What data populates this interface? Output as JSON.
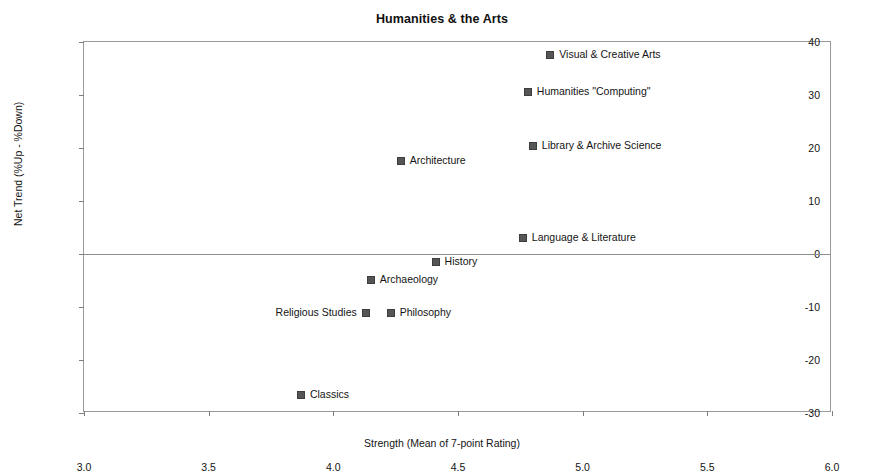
{
  "chart_data": {
    "type": "scatter",
    "title": "Humanities & the Arts",
    "xlabel": "Strength (Mean of 7-point Rating)",
    "ylabel": "Net Trend (%Up - %Down)",
    "xlim": [
      3.0,
      6.0
    ],
    "ylim": [
      -30,
      40
    ],
    "xticks": [
      "3.0",
      "3.5",
      "4.0",
      "4.5",
      "5.0",
      "5.5",
      "6.0"
    ],
    "xtick_values": [
      3.0,
      3.5,
      4.0,
      4.5,
      5.0,
      5.5,
      6.0
    ],
    "yticks": [
      "40",
      "30",
      "20",
      "10",
      "0",
      "-10",
      "-20",
      "-30"
    ],
    "ytick_values": [
      40,
      30,
      20,
      10,
      0,
      -10,
      -20,
      -30
    ],
    "grid": false,
    "legend": "none",
    "zero_reference_line": 0,
    "marker_color": "#555555",
    "points": [
      {
        "label": "Visual & Creative Arts",
        "x": 4.87,
        "y": 37.5,
        "label_side": "right"
      },
      {
        "label": "Humanities \"Computing\"",
        "x": 4.78,
        "y": 30.5,
        "label_side": "right"
      },
      {
        "label": "Library & Archive Science",
        "x": 4.8,
        "y": 20.4,
        "label_side": "right"
      },
      {
        "label": "Architecture",
        "x": 4.27,
        "y": 17.5,
        "label_side": "right"
      },
      {
        "label": "Language & Literature",
        "x": 4.76,
        "y": 3.0,
        "label_side": "right"
      },
      {
        "label": "History",
        "x": 4.41,
        "y": -1.5,
        "label_side": "right"
      },
      {
        "label": "Archaeology",
        "x": 4.15,
        "y": -4.9,
        "label_side": "right"
      },
      {
        "label": "Religious Studies",
        "x": 4.13,
        "y": -11.1,
        "label_side": "left"
      },
      {
        "label": "Philosophy",
        "x": 4.23,
        "y": -11.1,
        "label_side": "right"
      },
      {
        "label": "Classics",
        "x": 3.87,
        "y": -26.6,
        "label_side": "right"
      }
    ]
  }
}
